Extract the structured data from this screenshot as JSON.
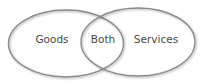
{
  "diagram": {
    "type": "venn",
    "background_color": "#ffffff",
    "stroke_color": "#8a8a8a",
    "text_color": "#474747",
    "sets": [
      {
        "id": "goods",
        "label": "Goods",
        "shape": {
          "cx": 66,
          "cy": 43.5,
          "rx": 57.5,
          "ry": 33.5
        }
      },
      {
        "id": "services",
        "label": "Services",
        "shape": {
          "cx": 138,
          "cy": 42,
          "rx": 57,
          "ry": 34
        }
      }
    ],
    "intersection": {
      "label": "Both"
    }
  }
}
